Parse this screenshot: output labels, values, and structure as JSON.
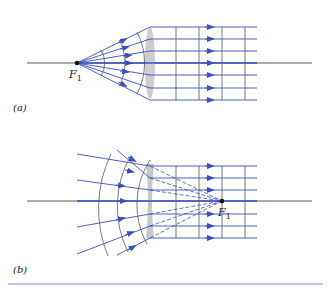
{
  "figure": {
    "panel_a": {
      "label": "(a)",
      "focal_point_label": "F",
      "focal_point_subscript": "1",
      "description": "Point source at focal point F1; diverging rays and spherical wavefronts become parallel rays and plane wavefronts after passing through converging lens"
    },
    "panel_b": {
      "label": "(b)",
      "focal_point_label": "F",
      "focal_point_subscript": "1",
      "description": "Converging spherical wavefronts directed toward F1 become parallel rays and plane wavefronts after passing through diverging lens; dashed lines show extensions to F1"
    },
    "colors": {
      "ray": "#3a4fc0",
      "axis": "#333333",
      "wavefront": "#444444",
      "lens": "#c8c8cc",
      "rule": "#7a8ae0"
    }
  }
}
